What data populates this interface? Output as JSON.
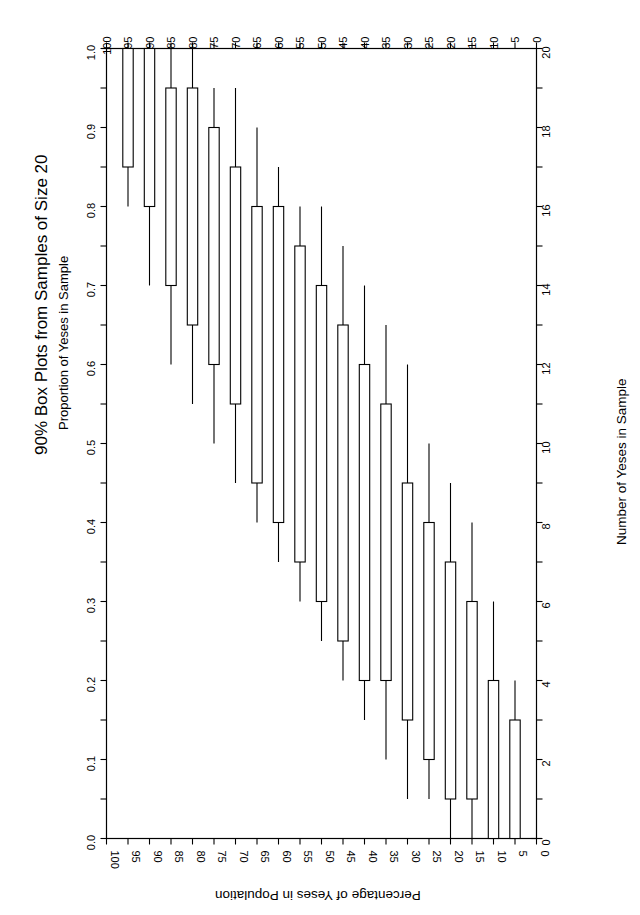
{
  "figure": {
    "title": "90% Box Plots from Samples of Size 20",
    "subtitle": "Proportion of Yeses in Sample",
    "bottom_axis_title": "Percentage of Yeses in Population",
    "right_axis_title": "Number of Yeses in Sample",
    "left_axis_title": "Proportion of Yeses in Sample"
  },
  "chart_data": {
    "type": "box",
    "orientation": "rotated-landscape",
    "title": "90% Box Plots from Samples of Size 20",
    "subtitle": "Proportion of Yeses in Sample",
    "xlabel": "Percentage of Yeses in Population",
    "ylabel": "Proportion of Yeses in Sample",
    "y2label": "Number of Yeses in Sample",
    "xlim": [
      100,
      0
    ],
    "ylim": [
      0.0,
      1.0
    ],
    "y2lim": [
      0,
      20
    ],
    "grid": false,
    "legend": null,
    "x_tick_labels": [
      "100",
      "95",
      "90",
      "85",
      "80",
      "75",
      "70",
      "65",
      "60",
      "55",
      "50",
      "45",
      "40",
      "35",
      "30",
      "25",
      "20",
      "15",
      "10",
      "5",
      "0"
    ],
    "x_tick_values": [
      100,
      95,
      90,
      85,
      80,
      75,
      70,
      65,
      60,
      55,
      50,
      45,
      40,
      35,
      30,
      25,
      20,
      15,
      10,
      5,
      0
    ],
    "y_tick_labels": [
      "0.0",
      "0.1",
      "0.2",
      "0.3",
      "0.4",
      "0.5",
      "0.6",
      "0.7",
      "0.8",
      "0.9",
      "1.0"
    ],
    "y_tick_values": [
      0.0,
      0.1,
      0.2,
      0.3,
      0.4,
      0.5,
      0.6,
      0.7,
      0.8,
      0.9,
      1.0
    ],
    "y2_tick_labels": [
      "0",
      "2",
      "4",
      "6",
      "8",
      "10",
      "12",
      "14",
      "16",
      "18",
      "20"
    ],
    "y2_tick_values": [
      0,
      2,
      4,
      6,
      8,
      10,
      12,
      14,
      16,
      18,
      20
    ],
    "x_minor_step": 5,
    "y_minor_step": 0.05,
    "y2_minor_step": 1,
    "boxes": [
      {
        "population_pct": 100,
        "lower_whisker": 1.0,
        "box_bottom": 1.0,
        "box_top": 1.0,
        "upper_whisker": 1.0
      },
      {
        "population_pct": 95,
        "lower_whisker": 0.8,
        "box_bottom": 0.85,
        "box_top": 1.0,
        "upper_whisker": 1.0
      },
      {
        "population_pct": 90,
        "lower_whisker": 0.7,
        "box_bottom": 0.8,
        "box_top": 1.0,
        "upper_whisker": 1.0
      },
      {
        "population_pct": 85,
        "lower_whisker": 0.6,
        "box_bottom": 0.7,
        "box_top": 0.95,
        "upper_whisker": 1.0
      },
      {
        "population_pct": 80,
        "lower_whisker": 0.55,
        "box_bottom": 0.65,
        "box_top": 0.95,
        "upper_whisker": 1.0
      },
      {
        "population_pct": 75,
        "lower_whisker": 0.5,
        "box_bottom": 0.6,
        "box_top": 0.9,
        "upper_whisker": 0.95
      },
      {
        "population_pct": 70,
        "lower_whisker": 0.45,
        "box_bottom": 0.55,
        "box_top": 0.85,
        "upper_whisker": 0.95
      },
      {
        "population_pct": 65,
        "lower_whisker": 0.4,
        "box_bottom": 0.45,
        "box_top": 0.8,
        "upper_whisker": 0.9
      },
      {
        "population_pct": 60,
        "lower_whisker": 0.35,
        "box_bottom": 0.4,
        "box_top": 0.8,
        "upper_whisker": 0.85
      },
      {
        "population_pct": 55,
        "lower_whisker": 0.3,
        "box_bottom": 0.35,
        "box_top": 0.75,
        "upper_whisker": 0.8
      },
      {
        "population_pct": 50,
        "lower_whisker": 0.25,
        "box_bottom": 0.3,
        "box_top": 0.7,
        "upper_whisker": 0.8
      },
      {
        "population_pct": 45,
        "lower_whisker": 0.2,
        "box_bottom": 0.25,
        "box_top": 0.65,
        "upper_whisker": 0.75
      },
      {
        "population_pct": 40,
        "lower_whisker": 0.15,
        "box_bottom": 0.2,
        "box_top": 0.6,
        "upper_whisker": 0.7
      },
      {
        "population_pct": 35,
        "lower_whisker": 0.1,
        "box_bottom": 0.2,
        "box_top": 0.55,
        "upper_whisker": 0.65
      },
      {
        "population_pct": 30,
        "lower_whisker": 0.05,
        "box_bottom": 0.15,
        "box_top": 0.45,
        "upper_whisker": 0.6
      },
      {
        "population_pct": 25,
        "lower_whisker": 0.05,
        "box_bottom": 0.1,
        "box_top": 0.4,
        "upper_whisker": 0.5
      },
      {
        "population_pct": 20,
        "lower_whisker": 0.0,
        "box_bottom": 0.05,
        "box_top": 0.35,
        "upper_whisker": 0.45
      },
      {
        "population_pct": 15,
        "lower_whisker": 0.0,
        "box_bottom": 0.05,
        "box_top": 0.3,
        "upper_whisker": 0.4
      },
      {
        "population_pct": 10,
        "lower_whisker": 0.0,
        "box_bottom": 0.0,
        "box_top": 0.2,
        "upper_whisker": 0.3
      },
      {
        "population_pct": 5,
        "lower_whisker": 0.0,
        "box_bottom": 0.0,
        "box_top": 0.15,
        "upper_whisker": 0.2
      },
      {
        "population_pct": 0,
        "lower_whisker": 0.0,
        "box_bottom": 0.0,
        "box_top": 0.0,
        "upper_whisker": 0.0
      }
    ]
  }
}
